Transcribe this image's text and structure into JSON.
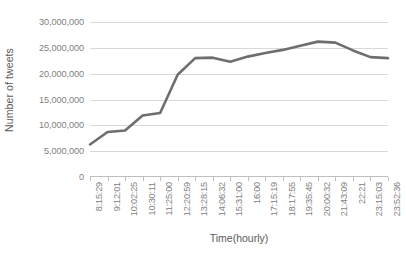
{
  "chart_data": {
    "type": "line",
    "title": "",
    "xlabel": "Time(hourly)",
    "ylabel": "Number of tweets",
    "ylim": [
      0,
      30000000
    ],
    "ytick_labels": [
      "30,000,000",
      "25,000,000",
      "20,000,000",
      "15,000,000",
      "10,000,000",
      "5,000,000",
      "0"
    ],
    "ytick_values": [
      30000000,
      25000000,
      20000000,
      15000000,
      10000000,
      5000000,
      0
    ],
    "grid": true,
    "legend": "none",
    "line_color": "#6E6E6E",
    "categories": [
      "8:15:29",
      "9:12:01",
      "10:02:25",
      "10:30:11",
      "11:25:00",
      "12:20:59",
      "13:28:15",
      "14:06:32",
      "15:31:00",
      "16:00",
      "17:15:19",
      "18:17:55",
      "19:35:45",
      "20:00:32",
      "21:43:09",
      "22:21",
      "23:15:03",
      "23:52:36"
    ],
    "values": [
      6300000,
      8700000,
      9000000,
      11900000,
      12400000,
      19800000,
      23000000,
      23100000,
      22300000,
      23300000,
      24000000,
      24600000,
      25400000,
      26200000,
      26000000,
      24500000,
      23200000,
      23000000
    ]
  }
}
